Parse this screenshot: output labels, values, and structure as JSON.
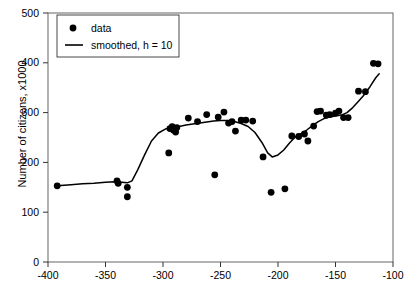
{
  "chart_data": {
    "type": "scatter",
    "title": "",
    "xlabel": "",
    "ylabel": "Number of citizens, x1000",
    "xlim": [
      -400,
      -100
    ],
    "ylim": [
      0,
      500
    ],
    "xticks": [
      -400,
      -350,
      -300,
      -250,
      -200,
      -150,
      -100
    ],
    "yticks": [
      0,
      100,
      200,
      300,
      400,
      500
    ],
    "grid": false,
    "legend_position": "top-left",
    "series": [
      {
        "name": "data",
        "marker": "circle",
        "color": "#000000",
        "points": [
          [
            -392,
            153
          ],
          [
            -340,
            163
          ],
          [
            -339,
            158
          ],
          [
            -331,
            150
          ],
          [
            -331,
            131
          ],
          [
            -295,
            219
          ],
          [
            -294,
            268
          ],
          [
            -292,
            272
          ],
          [
            -291,
            265
          ],
          [
            -289,
            261
          ],
          [
            -288,
            270
          ],
          [
            -278,
            289
          ],
          [
            -270,
            282
          ],
          [
            -262,
            296
          ],
          [
            -255,
            175
          ],
          [
            -252,
            291
          ],
          [
            -247,
            301
          ],
          [
            -243,
            279
          ],
          [
            -240,
            282
          ],
          [
            -237,
            263
          ],
          [
            -232,
            285
          ],
          [
            -228,
            285
          ],
          [
            -222,
            283
          ],
          [
            -213,
            211
          ],
          [
            -206,
            140
          ],
          [
            -194,
            147
          ],
          [
            -188,
            253
          ],
          [
            -182,
            252
          ],
          [
            -177,
            257
          ],
          [
            -174,
            243
          ],
          [
            -169,
            273
          ],
          [
            -166,
            302
          ],
          [
            -163,
            303
          ],
          [
            -158,
            295
          ],
          [
            -155,
            296
          ],
          [
            -150,
            299
          ],
          [
            -147,
            303
          ],
          [
            -143,
            290
          ],
          [
            -139,
            290
          ],
          [
            -130,
            343
          ],
          [
            -124,
            342
          ],
          [
            -117,
            399
          ],
          [
            -113,
            398
          ]
        ]
      }
    ],
    "smoothed": {
      "name": "smoothed, h = 10",
      "color": "#000000",
      "points": [
        [
          -392,
          153
        ],
        [
          -380,
          155
        ],
        [
          -370,
          157
        ],
        [
          -360,
          158
        ],
        [
          -350,
          160
        ],
        [
          -342,
          161
        ],
        [
          -336,
          160
        ],
        [
          -331,
          159
        ],
        [
          -327,
          163
        ],
        [
          -322,
          185
        ],
        [
          -316,
          215
        ],
        [
          -310,
          243
        ],
        [
          -304,
          259
        ],
        [
          -298,
          267
        ],
        [
          -292,
          270
        ],
        [
          -286,
          272
        ],
        [
          -280,
          275
        ],
        [
          -274,
          277
        ],
        [
          -268,
          279
        ],
        [
          -262,
          281
        ],
        [
          -256,
          283
        ],
        [
          -250,
          284
        ],
        [
          -244,
          284
        ],
        [
          -238,
          282
        ],
        [
          -232,
          278
        ],
        [
          -226,
          272
        ],
        [
          -220,
          260
        ],
        [
          -214,
          240
        ],
        [
          -209,
          219
        ],
        [
          -205,
          211
        ],
        [
          -200,
          215
        ],
        [
          -195,
          225
        ],
        [
          -190,
          239
        ],
        [
          -185,
          251
        ],
        [
          -180,
          258
        ],
        [
          -175,
          265
        ],
        [
          -170,
          274
        ],
        [
          -165,
          282
        ],
        [
          -160,
          288
        ],
        [
          -155,
          291
        ],
        [
          -150,
          293
        ],
        [
          -145,
          295
        ],
        [
          -140,
          300
        ],
        [
          -135,
          310
        ],
        [
          -130,
          323
        ],
        [
          -125,
          336
        ],
        [
          -120,
          352
        ],
        [
          -115,
          370
        ],
        [
          -112,
          378
        ]
      ]
    },
    "legend": [
      {
        "label": "data",
        "marker": "circle"
      },
      {
        "label": "smoothed, h = 10",
        "marker": "line"
      }
    ]
  }
}
